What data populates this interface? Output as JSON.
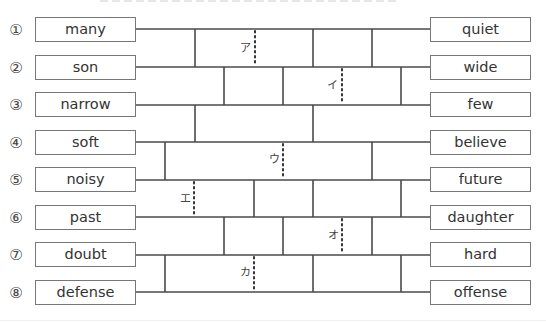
{
  "exercise": {
    "type": "amidakuji-antonym-matching",
    "left_items": [
      {
        "number": "①",
        "word": "many"
      },
      {
        "number": "②",
        "word": "son"
      },
      {
        "number": "③",
        "word": "narrow"
      },
      {
        "number": "④",
        "word": "soft"
      },
      {
        "number": "⑤",
        "word": "noisy"
      },
      {
        "number": "⑥",
        "word": "past"
      },
      {
        "number": "⑦",
        "word": "doubt"
      },
      {
        "number": "⑧",
        "word": "defense"
      }
    ],
    "right_items": [
      {
        "word": "quiet"
      },
      {
        "word": "wide"
      },
      {
        "word": "few"
      },
      {
        "word": "believe"
      },
      {
        "word": "future"
      },
      {
        "word": "daughter"
      },
      {
        "word": "hard"
      },
      {
        "word": "offense"
      }
    ],
    "blank_labels": [
      "ア",
      "イ",
      "ウ",
      "エ",
      "オ",
      "カ"
    ],
    "line_color": "#4a4a4a",
    "box_border_color": "#777777"
  }
}
